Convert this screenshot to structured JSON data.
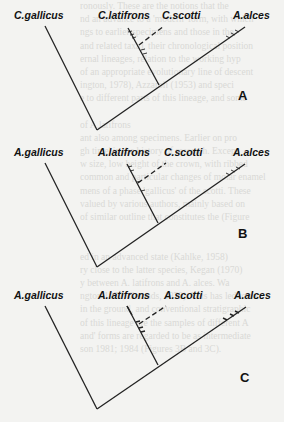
{
  "figure": {
    "panels": [
      {
        "letter": "A",
        "taxa": [
          "C.gallicus",
          "C.latifrons",
          "C.scotti",
          "A.alces"
        ],
        "dashed_branch_to": "C.scotti"
      },
      {
        "letter": "B",
        "taxa": [
          "A.gallicus",
          "A.latifrons",
          "C.scotti",
          "A.alces"
        ],
        "dashed_branch_to": "C.scotti"
      },
      {
        "letter": "C",
        "taxa": [
          "A.gallicus",
          "A.latifrons",
          "A.scotti",
          "A.alces"
        ],
        "dashed_branch_to": "A.scotti"
      }
    ]
  },
  "background_text": [
    "ronously. These are the notions that the",
    "nd an advance to a 'modern' form, with which",
    "ngs to earlier specimens and those in the",
    "and related taxa), their chronological position",
    "ernal lineages, relation to the working hyp",
    "of an appropriate evolutionary line of descent",
    "ington, 1978), Azzaroli (1953) and speci",
    "e to different parts of this lineage, and some",
    "",
    "of A.latifrons",
    "ant also among specimens. Earlier on pro",
    "gh time' in the history of research. Except",
    "w size, low height of the crown, with ribbed",
    "common and particular changes of molar enamel",
    "mens of a phase 'gallicus' of the scotti. These",
    "valued by various authors, mainly based on",
    "of similar outline that constitutes the (Figure",
    "",
    "",
    "ed in an advanced state (Kahlke, 1958)",
    "ry close to the latter species, Kegan (1970)",
    "y between A. latifrons and A. alces. Wa",
    "ngton 1977; Geraads, 1979). This has led to the",
    "in the ground, and conventional stratigraphic",
    "of this lineage are the samples of different A",
    "and' forms are regarded to be as intermediate",
    "son 1981; 1984 (Figures 3B and 3C)."
  ]
}
